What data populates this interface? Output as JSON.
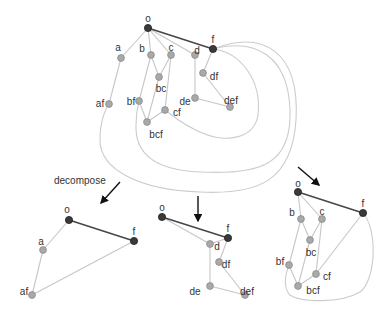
{
  "caption": {
    "decompose": "decompose"
  },
  "colors": {
    "dark_node": "#3a3a3a",
    "light_node": "#a9a9a9",
    "light_edge": "#c6c6c6",
    "dark_edge": "#474747",
    "arrow": "#111111"
  },
  "graphs": {
    "top": {
      "nodes": [
        {
          "id": "o",
          "label": "o",
          "x": 148,
          "y": 28,
          "dark": true,
          "lx": 148,
          "ly": 19
        },
        {
          "id": "f",
          "label": "f",
          "x": 213,
          "y": 49,
          "dark": true,
          "lx": 213,
          "ly": 40
        },
        {
          "id": "a",
          "label": "a",
          "x": 121,
          "y": 58,
          "lx": 118,
          "ly": 48
        },
        {
          "id": "b",
          "label": "b",
          "x": 151,
          "y": 55,
          "lx": 142,
          "ly": 49
        },
        {
          "id": "c",
          "label": "c",
          "x": 171,
          "y": 55,
          "lx": 171,
          "ly": 48
        },
        {
          "id": "d",
          "label": "d",
          "x": 195,
          "y": 55,
          "lx": 197,
          "ly": 51
        },
        {
          "id": "bc",
          "label": "bc",
          "x": 159,
          "y": 77,
          "lx": 161,
          "ly": 89
        },
        {
          "id": "df",
          "label": "df",
          "x": 203,
          "y": 73,
          "lx": 214,
          "ly": 77
        },
        {
          "id": "af",
          "label": "af",
          "x": 109,
          "y": 104,
          "lx": 100,
          "ly": 104
        },
        {
          "id": "bf",
          "label": "bf",
          "x": 139,
          "y": 101,
          "lx": 131,
          "ly": 102
        },
        {
          "id": "de",
          "label": "de",
          "x": 195,
          "y": 98,
          "lx": 185,
          "ly": 102
        },
        {
          "id": "def",
          "label": "def",
          "x": 230,
          "y": 107,
          "lx": 231,
          "ly": 101
        },
        {
          "id": "cf",
          "label": "cf",
          "x": 165,
          "y": 110,
          "lx": 177,
          "ly": 113
        },
        {
          "id": "bcf",
          "label": "bcf",
          "x": 147,
          "y": 122,
          "lx": 156,
          "ly": 135
        }
      ],
      "edges": [
        [
          "o",
          "a"
        ],
        [
          "o",
          "b"
        ],
        [
          "o",
          "c"
        ],
        [
          "o",
          "d"
        ],
        [
          "a",
          "af"
        ],
        [
          "b",
          "bc"
        ],
        [
          "c",
          "bc"
        ],
        [
          "b",
          "bf"
        ],
        [
          "bc",
          "bcf"
        ],
        [
          "bf",
          "bcf"
        ],
        [
          "c",
          "cf"
        ],
        [
          "cf",
          "bcf"
        ],
        [
          "d",
          "de"
        ],
        [
          "f",
          "df"
        ],
        [
          "df",
          "def"
        ],
        [
          "de",
          "def"
        ]
      ],
      "dark_edges": [
        [
          "o",
          "f"
        ]
      ],
      "loops": [
        "M213,49 C240,52 262,80 258,115 C254,140 225,142 205,134 C188,128 175,118 165,110",
        "M213,49 C255,38 288,55 290,110 C292,165 260,175 200,172 C150,170 135,150 136,125 C136,112 138,105 139,101",
        "M213,49 C262,30 300,50 296,120 C292,180 260,195 200,192 C140,190 100,170 100,140 C100,120 106,108 109,104"
      ]
    },
    "left": {
      "nodes": [
        {
          "id": "o",
          "label": "o",
          "x": 69,
          "y": 220,
          "dark": true,
          "lx": 67,
          "ly": 210
        },
        {
          "id": "f",
          "label": "f",
          "x": 134,
          "y": 241,
          "dark": true,
          "lx": 134,
          "ly": 232
        },
        {
          "id": "a",
          "label": "a",
          "x": 43,
          "y": 250,
          "lx": 41,
          "ly": 242
        },
        {
          "id": "af",
          "label": "af",
          "x": 32,
          "y": 295,
          "lx": 24,
          "ly": 292
        }
      ],
      "edges": [
        [
          "o",
          "a"
        ],
        [
          "a",
          "af"
        ],
        [
          "af",
          "f"
        ]
      ],
      "dark_edges": [
        [
          "o",
          "f"
        ]
      ],
      "loops": []
    },
    "middle": {
      "nodes": [
        {
          "id": "o",
          "label": "o",
          "x": 162,
          "y": 217,
          "dark": true,
          "lx": 162,
          "ly": 208
        },
        {
          "id": "f",
          "label": "f",
          "x": 228,
          "y": 238,
          "dark": true,
          "lx": 228,
          "ly": 229
        },
        {
          "id": "d",
          "label": "d",
          "x": 210,
          "y": 244,
          "lx": 217,
          "ly": 247
        },
        {
          "id": "df",
          "label": "df",
          "x": 219,
          "y": 262,
          "lx": 226,
          "ly": 265
        },
        {
          "id": "de",
          "label": "de",
          "x": 210,
          "y": 286,
          "lx": 195,
          "ly": 292
        },
        {
          "id": "def",
          "label": "def",
          "x": 245,
          "y": 295,
          "lx": 247,
          "ly": 292
        }
      ],
      "edges": [
        [
          "o",
          "d"
        ],
        [
          "d",
          "de"
        ],
        [
          "f",
          "df"
        ],
        [
          "df",
          "def"
        ],
        [
          "de",
          "def"
        ],
        [
          "f",
          "d"
        ]
      ],
      "dark_edges": [
        [
          "o",
          "f"
        ]
      ],
      "loops": []
    },
    "right": {
      "nodes": [
        {
          "id": "o",
          "label": "o",
          "x": 298,
          "y": 192,
          "dark": true,
          "lx": 298,
          "ly": 184
        },
        {
          "id": "f",
          "label": "f",
          "x": 363,
          "y": 213,
          "dark": true,
          "lx": 363,
          "ly": 204
        },
        {
          "id": "b",
          "label": "b",
          "x": 301,
          "y": 219,
          "lx": 292,
          "ly": 213
        },
        {
          "id": "c",
          "label": "c",
          "x": 322,
          "y": 219,
          "lx": 322,
          "ly": 212
        },
        {
          "id": "bc",
          "label": "bc",
          "x": 310,
          "y": 240,
          "lx": 311,
          "ly": 253
        },
        {
          "id": "bf",
          "label": "bf",
          "x": 289,
          "y": 265,
          "lx": 280,
          "ly": 262
        },
        {
          "id": "cf",
          "label": "cf",
          "x": 316,
          "y": 274,
          "lx": 327,
          "ly": 277
        },
        {
          "id": "bcf",
          "label": "bcf",
          "x": 298,
          "y": 286,
          "lx": 313,
          "ly": 291
        }
      ],
      "edges": [
        [
          "o",
          "b"
        ],
        [
          "o",
          "c"
        ],
        [
          "b",
          "bc"
        ],
        [
          "c",
          "bc"
        ],
        [
          "b",
          "bf"
        ],
        [
          "bc",
          "bcf"
        ],
        [
          "bf",
          "bcf"
        ],
        [
          "c",
          "cf"
        ],
        [
          "cf",
          "bcf"
        ],
        [
          "f",
          "cf"
        ]
      ],
      "dark_edges": [
        [
          "o",
          "f"
        ]
      ],
      "loops": [
        "M363,213 C378,230 376,280 360,292 C340,304 300,302 290,295 C283,288 285,275 289,265"
      ]
    }
  },
  "arrows": [
    {
      "id": "arrow-left",
      "x1": 120,
      "y1": 182,
      "x2": 101,
      "y2": 203
    },
    {
      "id": "arrow-middle",
      "x1": 198,
      "y1": 196,
      "x2": 198,
      "y2": 221
    },
    {
      "id": "arrow-right",
      "x1": 298,
      "y1": 167,
      "x2": 319,
      "y2": 185
    }
  ]
}
